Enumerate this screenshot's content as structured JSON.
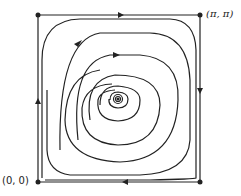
{
  "diagram": {
    "type": "phase-portrait",
    "labels": {
      "origin": "(0, 0)",
      "corner": "(π, π)"
    },
    "colors": {
      "stroke": "#222222",
      "background": "#ffffff"
    }
  }
}
